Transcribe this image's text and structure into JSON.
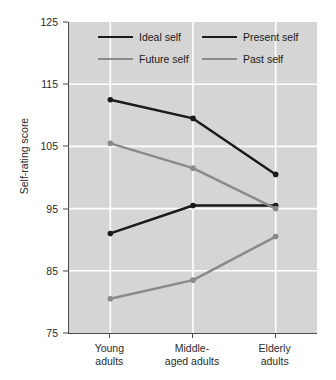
{
  "chart_data": {
    "type": "line",
    "title": "",
    "xlabel": "",
    "ylabel": "Self-rating score",
    "categories": [
      "Young adults",
      "Middle-aged adults",
      "Elderly adults"
    ],
    "category_lines": [
      [
        "Young",
        "adults"
      ],
      [
        "Middle-",
        "aged adults"
      ],
      [
        "Elderly",
        "adults"
      ]
    ],
    "ylim": [
      75,
      125
    ],
    "yticks": [
      125,
      115,
      105,
      95,
      85,
      75
    ],
    "grid": "horizontal-and-vertical-white",
    "legend_position": "inside-top-center",
    "series": [
      {
        "name": "Ideal self",
        "color": "#1a1a1a",
        "values": [
          112.5,
          109.5,
          100.5
        ]
      },
      {
        "name": "Present self",
        "color": "#1a1a1a",
        "values": [
          91.0,
          95.5,
          95.5
        ]
      },
      {
        "name": "Future self",
        "color": "#8a8a8a",
        "values": [
          105.5,
          101.5,
          95.0
        ]
      },
      {
        "name": "Past self",
        "color": "#8a8a8a",
        "values": [
          80.5,
          83.5,
          90.5
        ]
      }
    ],
    "colors": {
      "plot_background": "#d5d5d5",
      "gridline": "#ffffff",
      "axis": "#4a4a4a",
      "dark_series": "#1a1a1a",
      "light_series": "#8a8a8a",
      "text": "#2b2b2b"
    }
  }
}
